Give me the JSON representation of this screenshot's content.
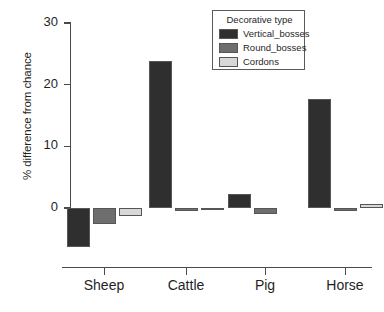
{
  "chart_data": {
    "type": "bar",
    "title": "",
    "xlabel": "",
    "ylabel": "% difference from chance",
    "categories": [
      "Sheep",
      "Cattle",
      "Pig",
      "Horse"
    ],
    "ylim": [
      -8,
      30
    ],
    "yticks": [
      0,
      10,
      20,
      30
    ],
    "ytick_labels": [
      "0",
      "10",
      "20",
      "30"
    ],
    "grid": false,
    "legend_position": "top-right",
    "legend_title": "Decorative type",
    "series": [
      {
        "name": "Vertical_bosses",
        "color": "#2f2f2f",
        "values": [
          -6.3,
          23.8,
          2.2,
          17.6
        ]
      },
      {
        "name": "Round_bosses",
        "color": "#6e6e6e",
        "values": [
          -2.6,
          -0.5,
          -1.0,
          -0.5
        ]
      },
      {
        "name": "Cordons",
        "color": "#d8d8d8",
        "values": [
          -1.3,
          -0.4,
          0.0,
          0.7
        ]
      }
    ]
  },
  "axis": {
    "y_title": "% difference from chance",
    "tick_0": "0",
    "tick_10": "10",
    "tick_20": "20",
    "tick_30": "30",
    "cat_0": "Sheep",
    "cat_1": "Cattle",
    "cat_2": "Pig",
    "cat_3": "Horse"
  },
  "legend": {
    "title": "Decorative type",
    "items": [
      {
        "label": "Vertical_bosses",
        "color": "#2f2f2f"
      },
      {
        "label": "Round_bosses",
        "color": "#6e6e6e"
      },
      {
        "label": "Cordons",
        "color": "#d8d8d8"
      }
    ]
  }
}
